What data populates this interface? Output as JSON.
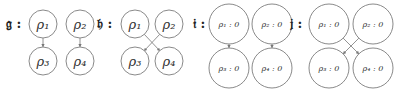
{
  "diagrams": [
    {
      "label": "𝔤 :",
      "nodes": [
        {
          "id": "p1",
          "text": "ρ₁",
          "cx": 43,
          "cy": 24,
          "r": 14
        },
        {
          "id": "p2",
          "text": "ρ₂",
          "cx": 80,
          "cy": 24,
          "r": 14
        },
        {
          "id": "p3",
          "text": "ρ₃",
          "cx": 43,
          "cy": 61,
          "r": 14
        },
        {
          "id": "p4",
          "text": "ρ₄",
          "cx": 80,
          "cy": 61,
          "r": 14
        }
      ],
      "edges": [
        [
          "p1",
          "p3"
        ],
        [
          "p2",
          "p4"
        ]
      ]
    },
    {
      "label": "𝔥 :",
      "nodes": [
        {
          "id": "p1",
          "text": "ρ₁",
          "cx": 135,
          "cy": 24,
          "r": 14
        },
        {
          "id": "p2",
          "text": "ρ₂",
          "cx": 169,
          "cy": 24,
          "r": 14
        },
        {
          "id": "p3",
          "text": "ρ₃",
          "cx": 135,
          "cy": 61,
          "r": 14
        },
        {
          "id": "p4",
          "text": "ρ₄",
          "cx": 169,
          "cy": 61,
          "r": 14
        }
      ],
      "edges": [
        [
          "p1",
          "p4"
        ],
        [
          "p2",
          "p3"
        ]
      ]
    },
    {
      "label": "𝔦 :",
      "nodes": [
        {
          "id": "p1",
          "text": "ρ₁ : 0",
          "cx": 229,
          "cy": 24,
          "r": 20
        },
        {
          "id": "p2",
          "text": "ρ₂ : 0",
          "cx": 272,
          "cy": 24,
          "r": 20
        },
        {
          "id": "p3",
          "text": "ρ₃ : 0",
          "cx": 229,
          "cy": 68,
          "r": 20
        },
        {
          "id": "p4",
          "text": "ρ₄ : 0",
          "cx": 272,
          "cy": 68,
          "r": 20
        }
      ],
      "edges": [
        [
          "p1",
          "p3"
        ],
        [
          "p2",
          "p4"
        ]
      ]
    },
    {
      "label": "𝔧 :",
      "nodes": [
        {
          "id": "p1",
          "text": "ρ₁ : 0",
          "cx": 329,
          "cy": 24,
          "r": 20
        },
        {
          "id": "p2",
          "text": "ρ₂ : 0",
          "cx": 373,
          "cy": 24,
          "r": 20
        },
        {
          "id": "p3",
          "text": "ρ₃ : 0",
          "cx": 329,
          "cy": 68,
          "r": 20
        },
        {
          "id": "p4",
          "text": "ρ₄ : 0",
          "cx": 373,
          "cy": 68,
          "r": 20
        }
      ],
      "edges": [
        [
          "p1",
          "p4"
        ],
        [
          "p2",
          "p3"
        ]
      ]
    }
  ],
  "label_positions": [
    {
      "x": 6,
      "y": 28
    },
    {
      "x": 97,
      "y": 28
    },
    {
      "x": 193,
      "y": 28
    },
    {
      "x": 290,
      "y": 28
    }
  ],
  "colors": {
    "stroke": "#8a8a8a",
    "edge": "#777777",
    "text": "#333333"
  }
}
